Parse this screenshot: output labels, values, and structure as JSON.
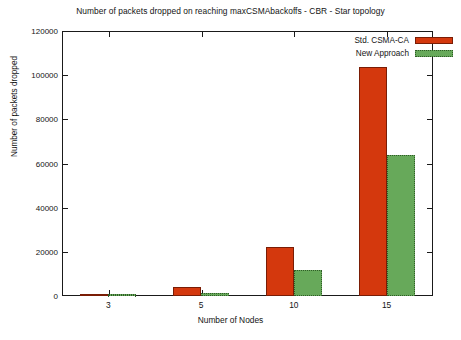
{
  "chart_data": {
    "type": "bar",
    "title": "Number of packets dropped on reaching maxCSMAbackoffs - CBR - Star topology",
    "xlabel": "Number of Nodes",
    "ylabel": "Number of packets dropped",
    "categories": [
      "3",
      "5",
      "10",
      "15"
    ],
    "series": [
      {
        "name": "Std. CSMA-CA",
        "color": "#d4380d",
        "values": [
          500,
          4200,
          22200,
          103500
        ]
      },
      {
        "name": "New Approach",
        "color": "#67a95a",
        "values": [
          300,
          1400,
          11700,
          64000
        ]
      }
    ],
    "ylim": [
      0,
      120000
    ],
    "yticks": [
      0,
      20000,
      40000,
      60000,
      80000,
      100000,
      120000
    ],
    "ytick_labels": [
      "0",
      "20000",
      "40000",
      "60000",
      "80000",
      "100000",
      "120000"
    ],
    "grid": false,
    "legend_position": "top-right"
  }
}
